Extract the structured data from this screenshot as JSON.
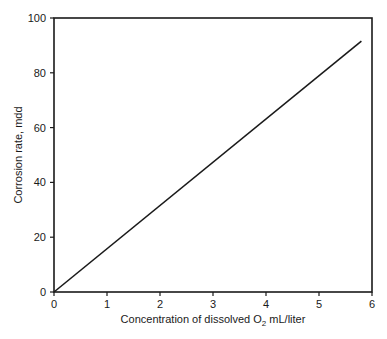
{
  "chart_data": {
    "type": "line",
    "title": "",
    "xlabel": "Concentration of dissolved O2 mL/liter",
    "xlabel_parts": {
      "pre": "Concentration of dissolved O",
      "sub": "2",
      "post": " mL/liter"
    },
    "ylabel": "Corrosion rate, mdd",
    "xlim": [
      0,
      6
    ],
    "ylim": [
      0,
      100
    ],
    "xticks": [
      "0",
      "1",
      "2",
      "3",
      "4",
      "5",
      "6"
    ],
    "yticks": [
      "0",
      "20",
      "40",
      "60",
      "80",
      "100"
    ],
    "grid": false,
    "legend": null,
    "series": [
      {
        "name": "Corrosion rate",
        "x": [
          0,
          5.8
        ],
        "y": [
          0,
          91.6
        ],
        "color": "#1a1a1a"
      }
    ]
  }
}
